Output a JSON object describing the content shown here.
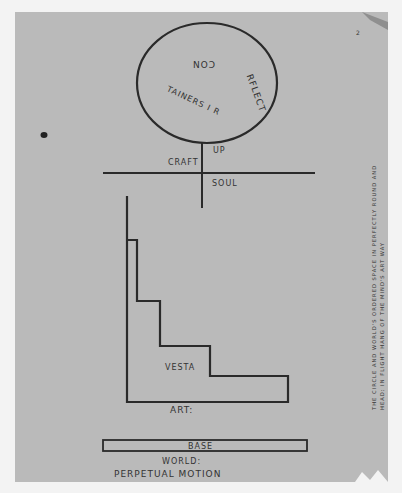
{
  "diagram": {
    "circle": {
      "inscription": "RFLECT TAINERS I R CON",
      "inscription_top": "CON",
      "inscription_right": "RFLECT",
      "inscription_bottom": "TAINERS I R"
    },
    "cross": {
      "up_label": "UP",
      "left_label": "CRAFT",
      "down_label": "SOUL"
    },
    "staircase": {
      "inner_label": "VESTA",
      "base_label": "ART:"
    },
    "base_bar": {
      "label": "BASE"
    },
    "footer": {
      "line1": "WORLD:",
      "line2": "PERPETUAL MOTION"
    },
    "margin_note": {
      "line1": "THE CIRCLE AND WORLD'S ORDERED SPACE IN PERFECTLY ROUND AND",
      "line2": "HEAD: IN FLIGHT HANG OF THE MIND'S ART WAY"
    },
    "page_number": "2",
    "colors": {
      "paper": "#bababa",
      "ink": "#2a2a2a",
      "background": "#f3f3f3"
    }
  }
}
